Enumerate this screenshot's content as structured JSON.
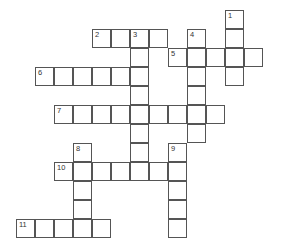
{
  "puzzle": {
    "type": "crossword",
    "cell_size": 19,
    "origin_x": 16,
    "origin_y": 10,
    "colors": {
      "border": "#555555",
      "cell": "#ffffff",
      "number": "#333333"
    },
    "entries": [
      {
        "number": "1",
        "direction": "down",
        "row": 0,
        "col": 11,
        "length": 4
      },
      {
        "number": "2",
        "direction": "across",
        "row": 1,
        "col": 4,
        "length": 4
      },
      {
        "number": "3",
        "direction": "down",
        "row": 1,
        "col": 6,
        "length": 8
      },
      {
        "number": "4",
        "direction": "down",
        "row": 1,
        "col": 9,
        "length": 6
      },
      {
        "number": "5",
        "direction": "across",
        "row": 2,
        "col": 8,
        "length": 5
      },
      {
        "number": "6",
        "direction": "across",
        "row": 3,
        "col": 1,
        "length": 6
      },
      {
        "number": "7",
        "direction": "across",
        "row": 5,
        "col": 2,
        "length": 9
      },
      {
        "number": "8",
        "direction": "down",
        "row": 7,
        "col": 3,
        "length": 5
      },
      {
        "number": "9",
        "direction": "down",
        "row": 7,
        "col": 8,
        "length": 5
      },
      {
        "number": "10",
        "direction": "across",
        "row": 8,
        "col": 2,
        "length": 7
      },
      {
        "number": "11",
        "direction": "across",
        "row": 11,
        "col": 0,
        "length": 5
      }
    ]
  }
}
